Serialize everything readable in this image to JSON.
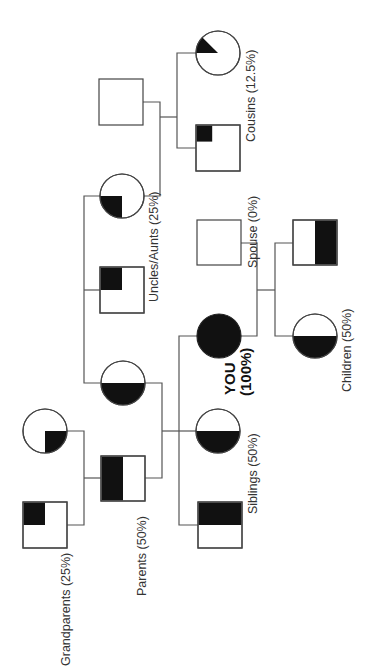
{
  "diagram": {
    "type": "pedigree",
    "title": "",
    "orientation": "rotated 90 degrees (generations run left to right)",
    "colors": {
      "fill": "#111111",
      "line": "#555555",
      "background": "#ffffff"
    },
    "labels": {
      "grandparents": "Grandparents (25%)",
      "parents": "Parents (50%)",
      "uncles_aunts": "Uncles/Aunts (25%)",
      "cousins": "Cousins (12.5%)",
      "siblings": "Siblings (50%)",
      "you_line1": "YOU",
      "you_line2": "(100%)",
      "spouse": "Spouse (0%)",
      "children": "Children (50%)"
    },
    "individuals": [
      {
        "id": "grandfather",
        "shape": "square",
        "generation": "grandparents",
        "shared_fraction": "25%"
      },
      {
        "id": "grandmother",
        "shape": "circle",
        "generation": "grandparents",
        "shared_fraction": "25%"
      },
      {
        "id": "father",
        "shape": "square",
        "generation": "parents",
        "shared_fraction": "50%"
      },
      {
        "id": "mother",
        "shape": "circle",
        "generation": "parents",
        "shared_fraction": "50%"
      },
      {
        "id": "uncle",
        "shape": "square",
        "generation": "uncles_aunts",
        "shared_fraction": "25%"
      },
      {
        "id": "aunt",
        "shape": "circle",
        "generation": "uncles_aunts",
        "shared_fraction": "25%"
      },
      {
        "id": "aunt-spouse",
        "shape": "square",
        "generation": "uncles_aunts",
        "shared_fraction": "0%"
      },
      {
        "id": "cousin-male",
        "shape": "square",
        "generation": "cousins",
        "shared_fraction": "12.5%"
      },
      {
        "id": "cousin-female",
        "shape": "circle",
        "generation": "cousins",
        "shared_fraction": "12.5%"
      },
      {
        "id": "you",
        "shape": "circle",
        "generation": "self",
        "shared_fraction": "100%"
      },
      {
        "id": "sister",
        "shape": "circle",
        "generation": "siblings",
        "shared_fraction": "50%"
      },
      {
        "id": "brother",
        "shape": "square",
        "generation": "siblings",
        "shared_fraction": "50%"
      },
      {
        "id": "spouse",
        "shape": "square",
        "generation": "self",
        "shared_fraction": "0%"
      },
      {
        "id": "son",
        "shape": "square",
        "generation": "children",
        "shared_fraction": "50%"
      },
      {
        "id": "daughter",
        "shape": "circle",
        "generation": "children",
        "shared_fraction": "50%"
      }
    ]
  }
}
